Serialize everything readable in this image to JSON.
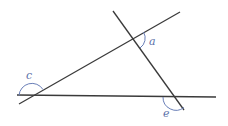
{
  "diagram": {
    "title": "",
    "type": "geometry-angles",
    "colors": {
      "line": "#3a3a3a",
      "arc": "#6a7fb8",
      "label": "#5a6fa8",
      "background": "#ffffff"
    },
    "lines": [
      {
        "id": "line-ascending",
        "x1": 19,
        "y1": 104,
        "x2": 180,
        "y2": 12
      },
      {
        "id": "line-descending",
        "x1": 113,
        "y1": 11,
        "x2": 184,
        "y2": 110
      },
      {
        "id": "line-horizontal",
        "x1": 17,
        "y1": 95,
        "x2": 216,
        "y2": 97
      }
    ],
    "angles": [
      {
        "id": "angle-a",
        "label": "a",
        "vertex": [
          133,
          38
        ],
        "label_pos": [
          149,
          45
        ]
      },
      {
        "id": "angle-c",
        "label": "c",
        "vertex": [
          32,
          96
        ],
        "label_pos": [
          26,
          79
        ]
      },
      {
        "id": "angle-e",
        "label": "e",
        "vertex": [
          176,
          97
        ],
        "label_pos": [
          163,
          117
        ]
      }
    ]
  }
}
